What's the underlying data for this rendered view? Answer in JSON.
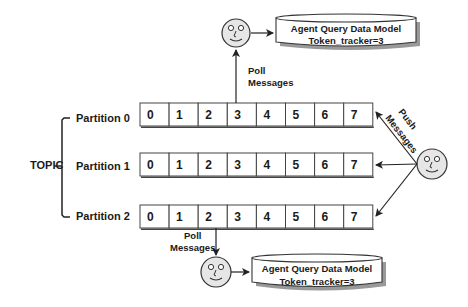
{
  "topic": {
    "label": "TOPIC"
  },
  "partitions": [
    {
      "label": "Partition 0",
      "cells": [
        "0",
        "1",
        "2",
        "3",
        "4",
        "5",
        "6",
        "7"
      ]
    },
    {
      "label": "Partition 1",
      "cells": [
        "0",
        "1",
        "2",
        "3",
        "4",
        "5",
        "6",
        "7"
      ]
    },
    {
      "label": "Partition 2",
      "cells": [
        "0",
        "1",
        "2",
        "3",
        "4",
        "5",
        "6",
        "7"
      ]
    }
  ],
  "top_consumer": {
    "icon": "smiley-face-icon",
    "poll_label_line1": "Poll",
    "poll_label_line2": "Messages",
    "db_line1": "Agent Query Data Model",
    "db_line2": "Token_tracker=3"
  },
  "bottom_consumer": {
    "icon": "smiley-face-icon",
    "poll_label_line1": "Poll",
    "poll_label_line2": "Messages",
    "db_line1": "Agent Query Data Model",
    "db_line2": "Token_tracker=3"
  },
  "producer": {
    "icon": "smiley-face-icon",
    "push_label_line1": "Push",
    "push_label_line2": "Messages"
  },
  "colors": {
    "face_fill": "#e6e6e6",
    "stroke": "#333333",
    "box_fill": "#ffffff",
    "shadow": "#555555"
  }
}
